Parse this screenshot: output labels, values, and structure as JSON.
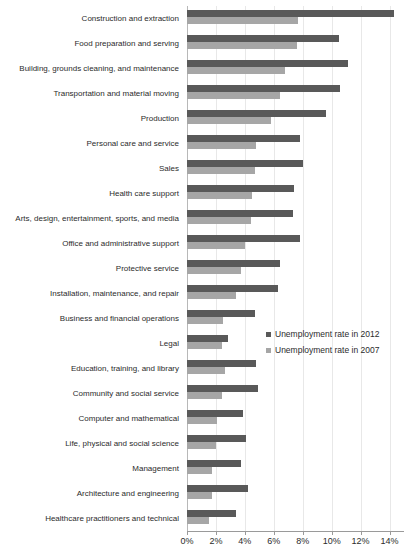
{
  "chart_data": {
    "type": "bar",
    "orientation": "horizontal",
    "title": "",
    "subtitle": "",
    "xlabel": "",
    "ylabel": "",
    "xlim": [
      0,
      15
    ],
    "xticks": [
      "0%",
      "2%",
      "4%",
      "6%",
      "8%",
      "10%",
      "12%",
      "14%"
    ],
    "xtick_values": [
      0,
      2,
      4,
      6,
      8,
      10,
      12,
      14
    ],
    "grid": true,
    "grid_axis": "x",
    "legend_position": "center-right",
    "categories": [
      "Construction and extraction",
      "Food preparation and serving",
      "Building, grounds cleaning, and maintenance",
      "Transportation and material moving",
      "Production",
      "Personal care and service",
      "Sales",
      "Health care support",
      "Arts, design, entertainment, sports, and media",
      "Office and administrative support",
      "Protective service",
      "Installation, maintenance, and repair",
      "Business and financial operations",
      "Legal",
      "Education, training, and library",
      "Community and social service",
      "Computer and mathematical",
      "Life, physical and social science",
      "Management",
      "Architecture and engineering",
      "Healthcare practitioners and technical"
    ],
    "series": [
      {
        "name": "Unemployment rate in 2012",
        "color": "#595959",
        "values": [
          14.3,
          10.5,
          11.1,
          10.6,
          9.6,
          7.8,
          8.0,
          7.4,
          7.3,
          7.8,
          6.4,
          6.3,
          4.7,
          2.8,
          4.8,
          4.9,
          3.9,
          4.1,
          3.7,
          4.2,
          3.4
        ]
      },
      {
        "name": "Unemployment rate in 2007",
        "color": "#a6a6a6",
        "values": [
          7.7,
          7.6,
          6.8,
          6.4,
          5.8,
          4.8,
          4.7,
          4.5,
          4.4,
          4.0,
          3.7,
          3.4,
          2.5,
          2.4,
          2.6,
          2.4,
          2.1,
          2.0,
          1.7,
          1.7,
          1.5
        ]
      }
    ]
  },
  "legend": {
    "items": [
      {
        "label": "Unemployment rate in 2012",
        "color": "#595959"
      },
      {
        "label": "Unemployment rate in 2007",
        "color": "#a6a6a6"
      }
    ]
  }
}
